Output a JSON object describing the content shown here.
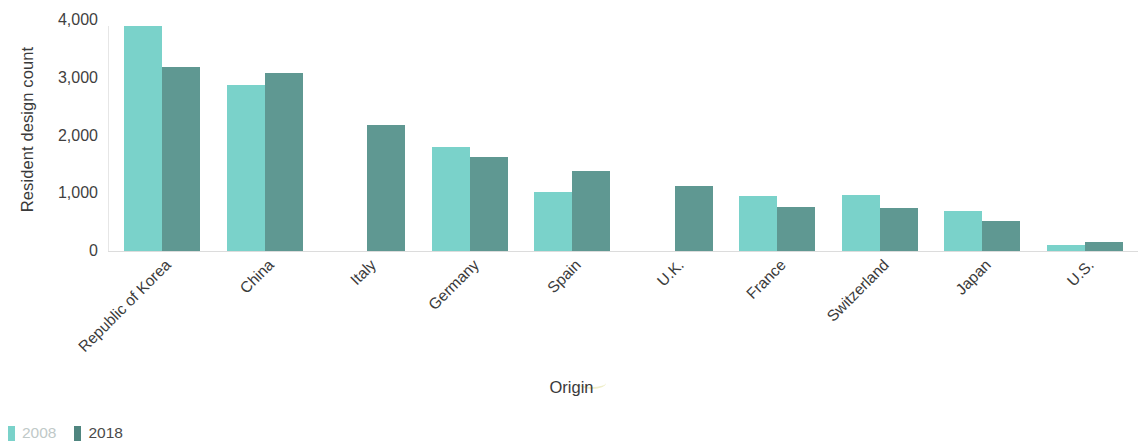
{
  "chart_data": {
    "type": "bar",
    "title": "",
    "xlabel": "Origin",
    "ylabel": "Resident design count",
    "categories": [
      "Republic of Korea",
      "China",
      "Italy",
      "Germany",
      "Spain",
      "U.K.",
      "France",
      "Switzerland",
      "Japan",
      "U.S."
    ],
    "series": [
      {
        "name": "2008",
        "color": "#7ad2ca",
        "values": [
          3900,
          2870,
          null,
          1800,
          1020,
          null,
          950,
          970,
          690,
          110
        ]
      },
      {
        "name": "2018",
        "color": "#5f9892",
        "values": [
          3180,
          3080,
          2180,
          1620,
          1390,
          1130,
          770,
          745,
          520,
          160
        ]
      }
    ],
    "ylim": [
      0,
      4000
    ],
    "yticks": [
      0,
      1000,
      2000,
      3000,
      4000
    ],
    "ytick_labels": [
      "0",
      "1,000",
      "2,000",
      "3,000",
      "4,000"
    ],
    "grid": false,
    "legend_position": "bottom-left"
  },
  "axes": {
    "y_title": "Resident design count",
    "x_title": "Origin"
  },
  "legend": {
    "items": [
      {
        "label": "2008",
        "color": "#7ad2ca"
      },
      {
        "label": "2018",
        "color": "#4f857f"
      }
    ]
  },
  "colors": {
    "series_2008": "#7ad2ca",
    "series_2018": "#5f9892",
    "axis": "#e0e0e0",
    "text": "#3b3b3b"
  }
}
